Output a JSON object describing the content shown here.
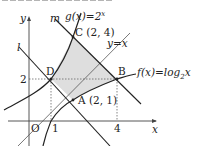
{
  "diagram": {
    "type": "coordinate-graph",
    "axes": {
      "x_label": "x",
      "y_label": "y",
      "origin_label": "O",
      "x_ticks": [
        "1",
        "4"
      ],
      "y_ticks": [
        "2"
      ]
    },
    "curves": {
      "g": {
        "label": "g(x)=2",
        "exponent": "x",
        "kind": "exponential"
      },
      "f": {
        "label": "f(x)=log",
        "base": "2",
        "arg": "x",
        "kind": "logarithm"
      },
      "identity": {
        "label": "y=x"
      }
    },
    "lines": {
      "l": {
        "label": "l"
      },
      "m": {
        "label": "m"
      }
    },
    "points": {
      "A": {
        "label": "A (2, 1)",
        "x": 2,
        "y": 1
      },
      "B": {
        "label": "B",
        "x": 4,
        "y": 2
      },
      "C": {
        "label": "C (2, 4)",
        "x": 2,
        "y": 4
      },
      "D": {
        "label": "D",
        "x": 1,
        "y": 2
      }
    },
    "shaded_region": {
      "vertices": [
        "D",
        "C",
        "B",
        "A"
      ],
      "color": "#dcdcdc"
    },
    "colors": {
      "stroke": "#222222",
      "axis": "#444444",
      "dotted": "#666666"
    }
  }
}
